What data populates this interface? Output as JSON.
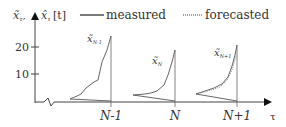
{
  "diagram": {
    "y_axis": {
      "label_main": "x̃",
      "label_main_sub": "τ",
      "label_secondary": "x̂",
      "label_secondary_sub": "τ",
      "label_unit": "[t]",
      "ticks": [
        {
          "value": "20",
          "y": 47
        },
        {
          "value": "10",
          "y": 74
        }
      ]
    },
    "x_axis": {
      "label": "τ",
      "ticks": [
        {
          "label": "N-1",
          "x": 111
        },
        {
          "label": "N",
          "x": 175
        },
        {
          "label": "N+1",
          "x": 237
        }
      ]
    },
    "legend": {
      "measured_label": "measured",
      "forecasted_label": "forecasted"
    },
    "curves": [
      {
        "label": "x̃",
        "sub": "N-1"
      },
      {
        "label": "x̃",
        "sub": "N"
      },
      {
        "label": "x̃",
        "sub": "N+1"
      }
    ]
  }
}
